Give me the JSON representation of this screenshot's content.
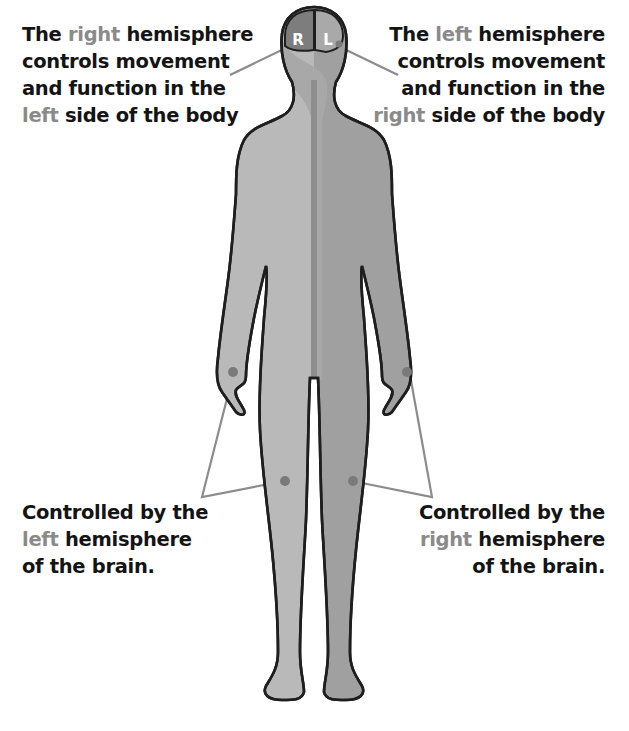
{
  "callouts": {
    "top_left": {
      "line1_pre": "The ",
      "line1_hl": "right",
      "line1_post": " hemisphere",
      "line2": "controls movement",
      "line3": "and function in the",
      "line4_hl": "left",
      "line4_post": " side of the body"
    },
    "top_right": {
      "line1_pre": "The ",
      "line1_hl": "left",
      "line1_post": " hemisphere",
      "line2": "controls movement",
      "line3": "and function in the",
      "line4_hl": "right",
      "line4_post": " side of the body"
    },
    "bottom_left": {
      "line1": "Controlled by the",
      "line2_hl": "left",
      "line2_post": " hemisphere",
      "line3": "of the brain."
    },
    "bottom_right": {
      "line1": "Controlled by the",
      "line2_hl": "right",
      "line2_post": " hemisphere",
      "line3": "of the brain."
    }
  },
  "brain": {
    "right_label": "R",
    "left_label": "L"
  },
  "colors": {
    "text": "#141414",
    "highlight": "#8a8a8a",
    "body_light": "#b9b9b9",
    "body_dark": "#9d9d9d",
    "outline": "#1e1e1e",
    "leader_line": "#8c8c8c"
  }
}
